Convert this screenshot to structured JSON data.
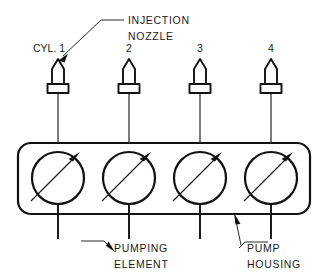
{
  "diagram": {
    "background_color": "#ffffff",
    "line_color": "#111111",
    "callouts": {
      "injection_nozzle_line1": "INJECTION",
      "injection_nozzle_line2": "NOZZLE",
      "pumping_element_line1": "PUMPING",
      "pumping_element_line2": "ELEMENT",
      "pump_housing_line1": "PUMP",
      "pump_housing_line2": "HOUSING"
    },
    "cylinders": [
      {
        "label": "CYL. 1",
        "x": 58
      },
      {
        "label": "2",
        "x": 129
      },
      {
        "label": "3",
        "x": 200
      },
      {
        "label": "4",
        "x": 271
      }
    ]
  }
}
